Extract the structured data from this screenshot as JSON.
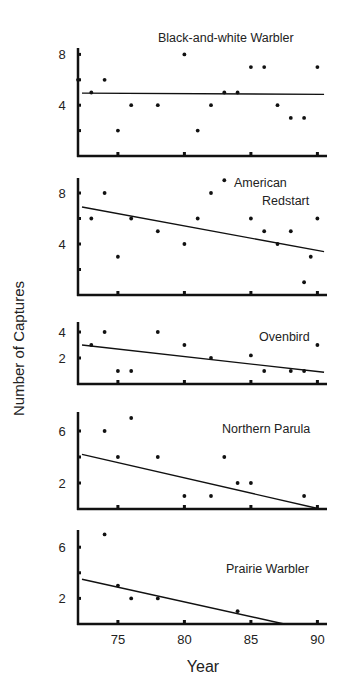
{
  "figure": {
    "ylabel": "Number of Captures",
    "xlabel": "Year",
    "x_ticks": [
      "75",
      "80",
      "85",
      "90"
    ]
  },
  "chart_data": [
    {
      "type": "scatter",
      "title": "Black-and-white Warbler",
      "xlabel": "Year",
      "ylabel": "Number of Captures",
      "xlim": [
        72,
        91
      ],
      "ylim": [
        0,
        8.5
      ],
      "y_ticks": [
        4,
        8
      ],
      "y_minor_ticks": [
        2,
        4,
        6,
        8
      ],
      "x": [
        72,
        73,
        74,
        75,
        76,
        78,
        80,
        81,
        82,
        83,
        84,
        85,
        86,
        87,
        88,
        89,
        90
      ],
      "y": [
        6,
        5,
        6,
        2,
        4,
        4,
        8,
        2,
        4,
        5,
        5,
        7,
        7,
        4,
        3,
        3,
        7
      ],
      "trend_line": {
        "x": [
          72.3,
          90.5
        ],
        "y": [
          4.95,
          4.85
        ]
      },
      "grid": false
    },
    {
      "type": "scatter",
      "title": "American Redstart",
      "title_lines": [
        "American",
        "Redstart"
      ],
      "xlabel": "Year",
      "ylabel": "Number of Captures",
      "xlim": [
        72,
        91
      ],
      "ylim": [
        0,
        9.5
      ],
      "y_ticks": [
        4,
        8
      ],
      "y_minor_ticks": [
        2,
        4,
        6,
        8
      ],
      "x": [
        73,
        74,
        75,
        76,
        78,
        80,
        81,
        82,
        83,
        85,
        86,
        87,
        88,
        89,
        89.5,
        90
      ],
      "y": [
        6,
        8,
        3,
        6,
        5,
        4,
        6,
        8,
        9,
        6,
        5,
        4,
        5,
        1,
        3,
        6
      ],
      "trend_line": {
        "x": [
          72.3,
          90.5
        ],
        "y": [
          6.9,
          3.4
        ]
      },
      "grid": false
    },
    {
      "type": "scatter",
      "title": "Ovenbird",
      "xlabel": "Year",
      "ylabel": "Number of Captures",
      "xlim": [
        72,
        91
      ],
      "ylim": [
        0,
        4.5
      ],
      "y_ticks": [
        2,
        4
      ],
      "y_minor_ticks": [
        2,
        4
      ],
      "x": [
        73,
        74,
        75,
        76,
        78,
        80,
        82,
        85,
        86,
        88,
        89,
        90
      ],
      "y": [
        3,
        4,
        1,
        1,
        4,
        3,
        2,
        2.2,
        1,
        1,
        1,
        3
      ],
      "trend_line": {
        "x": [
          72.3,
          90.5
        ],
        "y": [
          3.0,
          0.9
        ]
      },
      "grid": false
    },
    {
      "type": "scatter",
      "title": "Northern Parula",
      "xlabel": "Year",
      "ylabel": "Number of Captures",
      "xlim": [
        72,
        91
      ],
      "ylim": [
        0,
        7.5
      ],
      "y_ticks": [
        2,
        6
      ],
      "y_minor_ticks": [
        2,
        4,
        6
      ],
      "x": [
        74,
        75,
        76,
        78,
        80,
        82,
        83,
        84,
        85,
        89
      ],
      "y": [
        6,
        4,
        7,
        4,
        1,
        1,
        4,
        2,
        2,
        1
      ],
      "trend_line": {
        "x": [
          72.3,
          90.2
        ],
        "y": [
          4.2,
          0
        ]
      },
      "grid": false
    },
    {
      "type": "scatter",
      "title": "Prairie Warbler",
      "xlabel": "Year",
      "ylabel": "Number of Captures",
      "xlim": [
        72,
        91
      ],
      "ylim": [
        0,
        7.5
      ],
      "y_ticks": [
        2,
        6
      ],
      "y_minor_ticks": [
        2,
        4,
        6
      ],
      "x": [
        74,
        75,
        76,
        78,
        84
      ],
      "y": [
        7,
        3,
        2,
        2,
        1
      ],
      "trend_line": {
        "x": [
          72.3,
          87.5
        ],
        "y": [
          3.5,
          0
        ]
      },
      "x_ticks": [
        75,
        80,
        85,
        90
      ],
      "grid": false
    }
  ]
}
